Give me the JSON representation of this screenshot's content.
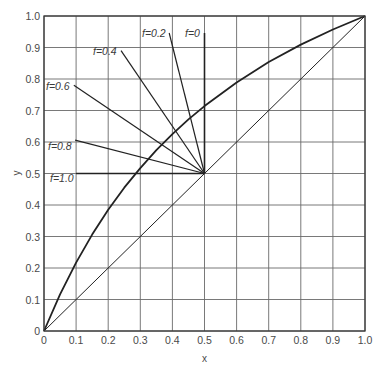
{
  "chart_data": {
    "type": "line",
    "title": "",
    "xlabel": "x",
    "ylabel": "y",
    "xlim": [
      0,
      1.0
    ],
    "ylim": [
      0,
      1.0
    ],
    "grid": true,
    "xticks": [
      "0",
      "0.1",
      "0.2",
      "0.3",
      "0.4",
      "0.5",
      "0.6",
      "0.7",
      "0.8",
      "0.9",
      "1.0"
    ],
    "yticks": [
      "0",
      "0.1",
      "0.2",
      "0.3",
      "0.4",
      "0.5",
      "0.6",
      "0.7",
      "0.8",
      "0.9",
      "1.0"
    ],
    "series": [
      {
        "name": "equilibrium curve",
        "style": "bold",
        "x": [
          0,
          0.05,
          0.1,
          0.15,
          0.2,
          0.25,
          0.3,
          0.35,
          0.4,
          0.45,
          0.5,
          0.6,
          0.7,
          0.8,
          0.9,
          1.0
        ],
        "y": [
          0,
          0.116,
          0.217,
          0.306,
          0.385,
          0.455,
          0.517,
          0.574,
          0.625,
          0.672,
          0.714,
          0.789,
          0.854,
          0.909,
          0.957,
          1.0
        ]
      },
      {
        "name": "diagonal y=x",
        "style": "thin",
        "x": [
          0,
          1.0
        ],
        "y": [
          0,
          1.0
        ]
      }
    ],
    "q_lines": [
      {
        "label": "f=0",
        "from": [
          0.5,
          0.5
        ],
        "to": [
          0.5,
          0.946
        ]
      },
      {
        "label": "f=0.2",
        "from": [
          0.5,
          0.5
        ],
        "to": [
          0.39,
          0.946
        ]
      },
      {
        "label": "f=0.4",
        "from": [
          0.5,
          0.5
        ],
        "to": [
          0.24,
          0.89
        ]
      },
      {
        "label": "f=0.6",
        "from": [
          0.5,
          0.5
        ],
        "to": [
          0.093,
          0.78
        ]
      },
      {
        "label": "f=0.8",
        "from": [
          0.5,
          0.5
        ],
        "to": [
          0.097,
          0.606
        ]
      },
      {
        "label": "f=1.0",
        "from": [
          0.5,
          0.5
        ],
        "to": [
          0.1,
          0.5
        ]
      }
    ],
    "annotations": [
      "f=0",
      "f=0.2",
      "f=0.4",
      "f=0.6",
      "f=0.8",
      "f=1.0"
    ]
  },
  "labels": {
    "x_axis": "x",
    "y_axis": "y",
    "x_ticks": [
      "0",
      "0.1",
      "0.2",
      "0.3",
      "0.4",
      "0.5",
      "0.6",
      "0.7",
      "0.8",
      "0.9",
      "1.0"
    ],
    "y_ticks": [
      "0",
      "0.1",
      "0.2",
      "0.3",
      "0.4",
      "0.5",
      "0.6",
      "0.7",
      "0.8",
      "0.9",
      "1.0"
    ],
    "f_labels": [
      "f=0",
      "f=0.2",
      "f=0.4",
      "f=0.6",
      "f=0.8",
      "f=1.0"
    ]
  }
}
